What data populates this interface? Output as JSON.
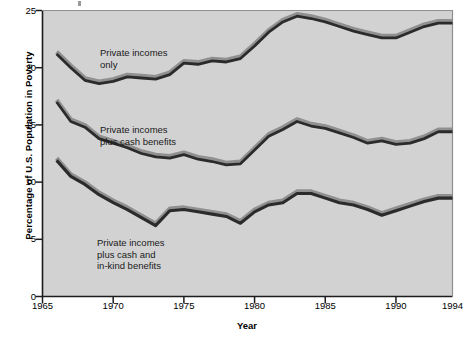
{
  "chart_data": {
    "type": "line",
    "title": "",
    "xlabel": "Year",
    "ylabel": "Percentage of U.S. Population in Poverty",
    "xlim": [
      1965,
      1994
    ],
    "ylim": [
      0,
      25
    ],
    "ytick_values": [
      0,
      5,
      10,
      15,
      20,
      25
    ],
    "ytick_labels": [
      "0",
      "5",
      "10",
      "15",
      "20",
      "25"
    ],
    "xtick_values": [
      1965,
      1970,
      1975,
      1980,
      1985,
      1990,
      1994
    ],
    "xtick_labels": [
      "1965",
      "1970",
      "1975",
      "1980",
      "1985",
      "1990",
      "1994"
    ],
    "grid": false,
    "legend_position": "inline-annotations",
    "plot_background": "#d2d2d2",
    "line_color": "#2b2b2b",
    "highlight_color": "#8c8c8c",
    "x": [
      1966,
      1967,
      1968,
      1969,
      1970,
      1971,
      1972,
      1973,
      1974,
      1975,
      1976,
      1977,
      1978,
      1979,
      1980,
      1981,
      1982,
      1983,
      1984,
      1985,
      1986,
      1987,
      1988,
      1989,
      1990,
      1991,
      1992,
      1993,
      1994
    ],
    "series": [
      {
        "name": "Private incomes only",
        "label_lines": [
          "Private incomes",
          "only"
        ],
        "values": [
          21.2,
          20.0,
          18.9,
          18.6,
          18.8,
          19.2,
          19.1,
          19.0,
          19.4,
          20.4,
          20.3,
          20.6,
          20.5,
          20.8,
          21.9,
          23.1,
          24.0,
          24.5,
          24.3,
          24.0,
          23.6,
          23.2,
          22.9,
          22.6,
          22.6,
          23.1,
          23.6,
          23.9,
          23.9
        ]
      },
      {
        "name": "Private incomes plus cash benefits",
        "label_lines": [
          "Private incomes",
          "plus cash benefits"
        ],
        "values": [
          17.0,
          15.3,
          14.8,
          13.8,
          13.4,
          13.0,
          12.5,
          12.2,
          12.1,
          12.4,
          12.0,
          11.8,
          11.5,
          11.6,
          12.8,
          14.0,
          14.6,
          15.3,
          14.9,
          14.7,
          14.3,
          13.9,
          13.4,
          13.6,
          13.3,
          13.4,
          13.8,
          14.4,
          14.4
        ]
      },
      {
        "name": "Private incomes plus cash and in-kind benefits",
        "label_lines": [
          "Private incomes",
          "plus cash and",
          "in-kind benefits"
        ],
        "values": [
          11.9,
          10.5,
          9.8,
          8.9,
          8.2,
          7.6,
          6.9,
          6.2,
          7.5,
          7.6,
          7.4,
          7.2,
          7.0,
          6.4,
          7.4,
          8.0,
          8.2,
          9.0,
          9.0,
          8.6,
          8.2,
          8.0,
          7.6,
          7.1,
          7.5,
          7.9,
          8.3,
          8.6,
          8.6
        ]
      }
    ]
  }
}
